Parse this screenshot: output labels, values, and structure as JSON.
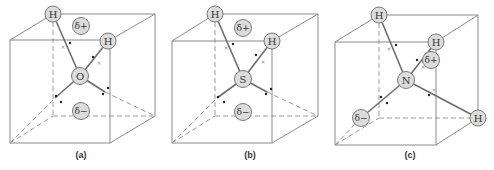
{
  "figure": {
    "panels": [
      {
        "label": "(a)",
        "central_atom": "O",
        "hydrogen_label": "H",
        "hydrogens": [
          "H",
          "H"
        ],
        "partial_positive": "δ+",
        "partial_negative": "δ−",
        "geometry": "bent (tetrahedral electron-pair arrangement, 2 lone pairs)"
      },
      {
        "label": "(b)",
        "central_atom": "S",
        "hydrogen_label": "H",
        "hydrogens": [
          "H",
          "H"
        ],
        "partial_positive": "δ+",
        "partial_negative": "δ−",
        "geometry": "bent (tetrahedral electron-pair arrangement, 2 lone pairs)"
      },
      {
        "label": "(c)",
        "central_atom": "N",
        "hydrogen_label": "H",
        "hydrogens": [
          "H",
          "H",
          "H"
        ],
        "partial_positive": "δ+",
        "partial_negative": "δ−",
        "geometry": "trigonal pyramidal (tetrahedral electron-pair arrangement, 1 lone pair)"
      }
    ]
  },
  "colors": {
    "atom_fill": "#dcdcdc",
    "atom_stroke": "#7a7a7a",
    "edge": "#8a8a8a",
    "bond": "#6e6e6e"
  }
}
